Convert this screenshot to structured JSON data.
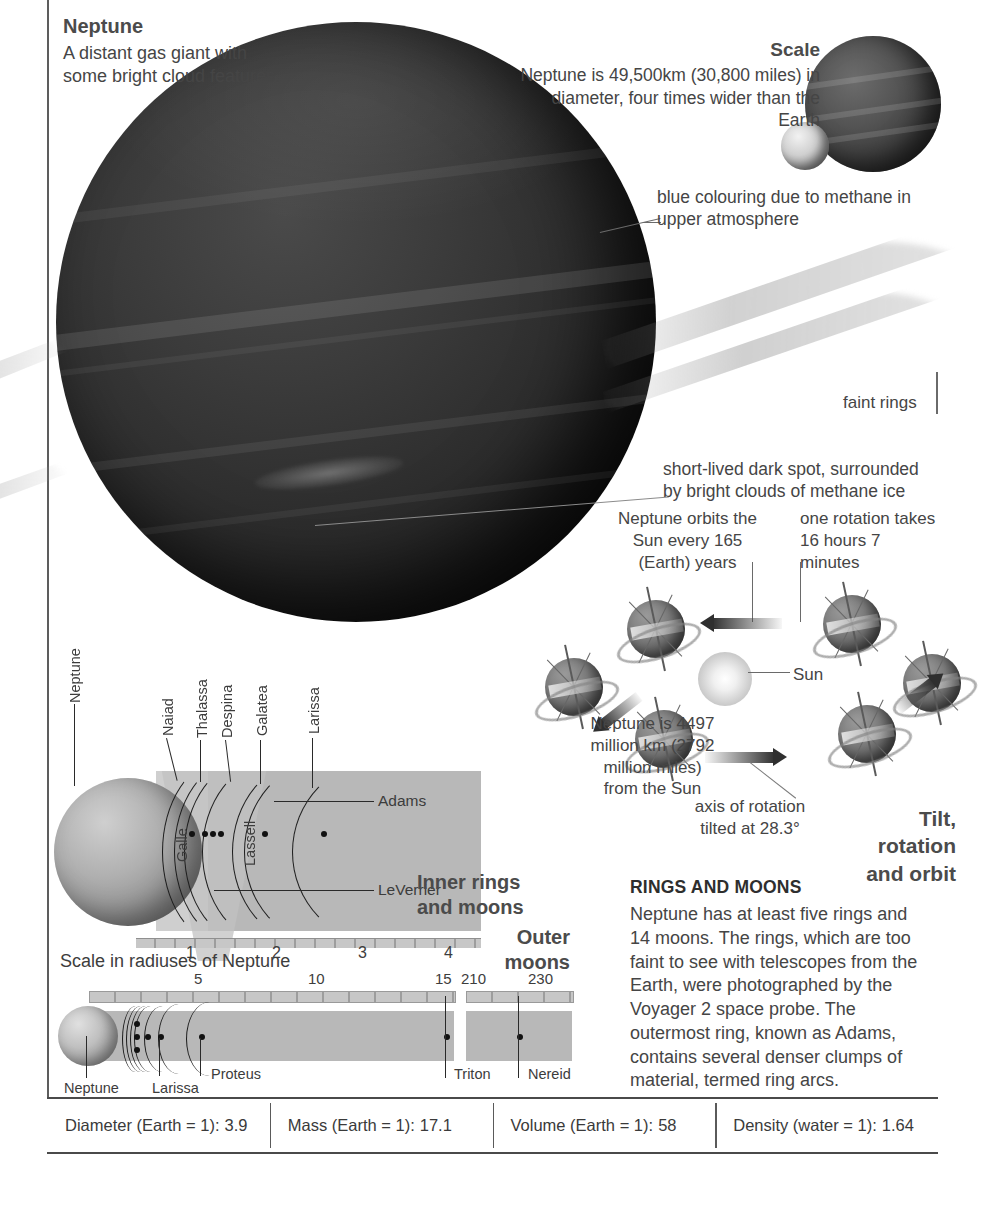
{
  "title_block": {
    "heading": "Neptune",
    "body": "A distant gas giant with some bright cloud features."
  },
  "scale_block": {
    "heading": "Scale",
    "body": "Neptune is 49,500km (30,800 miles) in diameter, four times wider than the Earth"
  },
  "callouts": {
    "methane": "blue colouring due to methane in upper atmosphere",
    "faint_rings": "faint rings",
    "dark_spot": "short-lived dark spot, surrounded by bright clouds of methane ice"
  },
  "orbit_section": {
    "title": "Tilt, rotation and orbit",
    "orbit_period": "Neptune orbits the Sun every 165 (Earth) years",
    "rotation_period": "one rotation takes 16 hours 7 minutes",
    "distance": "Neptune is 4497 million km (2792 million miles) from the Sun",
    "axis_tilt": "axis of rotation tilted at 28.3°",
    "sun_label": "Sun"
  },
  "inner_rings": {
    "title": "Inner rings and moons",
    "planet_label": "Neptune",
    "moon_labels": [
      "Naiad",
      "Thalassa",
      "Despina",
      "Galatea",
      "Larissa"
    ],
    "ring_labels_vertical": [
      "Galle",
      "Lassell"
    ],
    "ring_labels_right": [
      "Adams",
      "LeVerrier"
    ],
    "scale_caption": "Scale in radiuses of Neptune",
    "axis_ticks": [
      "1",
      "2",
      "3",
      "4"
    ]
  },
  "outer_moons": {
    "title": "Outer moons",
    "axis_ticks_main": [
      "5",
      "10",
      "15"
    ],
    "axis_ticks_far": [
      "210",
      "230"
    ],
    "labels": [
      "Neptune",
      "Larissa",
      "Proteus",
      "Triton",
      "Nereid"
    ]
  },
  "rings_and_moons": {
    "heading": "RINGS AND MOONS",
    "body": "Neptune has at least five rings and 14 moons. The rings, which are too faint to see with telescopes from the Earth, were photographed by the Voyager 2 space probe. The outermost ring, known as Adams, contains several denser clumps of material, termed ring arcs."
  },
  "facts_table": [
    {
      "label": "Diameter (Earth = 1):",
      "value": "3.9"
    },
    {
      "label": "Mass (Earth = 1):",
      "value": "17.1"
    },
    {
      "label": "Volume (Earth = 1):",
      "value": "58"
    },
    {
      "label": "Density (water = 1):",
      "value": "1.64"
    }
  ],
  "colors": {
    "text": "#3a3a3a",
    "heading": "#4b4b4b",
    "rule": "#5d5d5d",
    "band": "#b8b8b8"
  }
}
